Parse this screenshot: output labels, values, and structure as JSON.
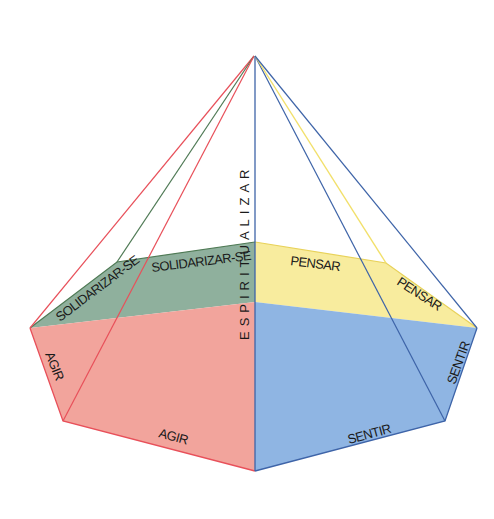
{
  "diagram": {
    "apex_label": "ESPIRITUALIZAR",
    "faces": [
      {
        "id": "solidarizar",
        "color": "#8fb09d",
        "labels": [
          "SOLIDARIZAR-SE",
          "SOLIDARIZAR-SE"
        ]
      },
      {
        "id": "pensar",
        "color": "#f8ec9e",
        "labels": [
          "PENSAR",
          "PENSAR"
        ]
      },
      {
        "id": "agir",
        "color": "#f2a49c",
        "labels": [
          "AGIR",
          "AGIR"
        ]
      },
      {
        "id": "sentir",
        "color": "#8fb5e3",
        "labels": [
          "SENTIR",
          "SENTIR"
        ]
      }
    ],
    "edge_colors": {
      "red": "#e8505a",
      "green": "#4f7a55",
      "yellow": "#f2e06a",
      "blue": "#3e64a8"
    }
  }
}
